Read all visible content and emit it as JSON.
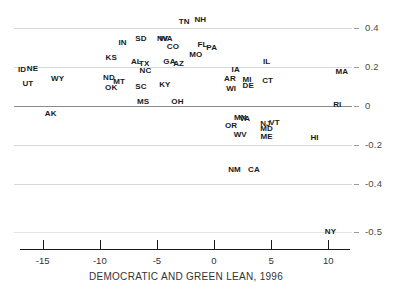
{
  "chart_data": {
    "type": "scatter",
    "title": "",
    "xlabel": "DEMOCRATIC AND GREEN LEAN, 1996",
    "ylabel": "",
    "xlim": [
      -17.5,
      12.5
    ],
    "ylim": [
      -0.55,
      0.47
    ],
    "grid": true,
    "legend": "none",
    "xticks": [
      "-15",
      "-10",
      "-5",
      "0",
      "5",
      "10"
    ],
    "xtick_values": [
      -15,
      -10,
      -5,
      0,
      5,
      10
    ],
    "yticks": [
      "0.4",
      "0.2",
      "0",
      "-0.2",
      "-0.4",
      "-0.5"
    ],
    "ytick_values": [
      0.4,
      0.2,
      0,
      -0.2,
      -0.4,
      -0.5
    ],
    "point_label_type": "state-abbreviation",
    "points": [
      {
        "label": "TN",
        "x": -2.6,
        "y": 0.435
      },
      {
        "label": "NH",
        "x": -1.2,
        "y": 0.445
      },
      {
        "label": "SD",
        "x": -6.4,
        "y": 0.345
      },
      {
        "label": "IN",
        "x": -8.0,
        "y": 0.325
      },
      {
        "label": "NV",
        "x": -4.5,
        "y": 0.345
      },
      {
        "label": "WA",
        "x": -4.2,
        "y": 0.345
      },
      {
        "label": "CO",
        "x": -3.6,
        "y": 0.305
      },
      {
        "label": "FL",
        "x": -1.0,
        "y": 0.315
      },
      {
        "label": "PA",
        "x": -0.2,
        "y": 0.3
      },
      {
        "label": "KS",
        "x": -9.0,
        "y": 0.245
      },
      {
        "label": "MO",
        "x": -1.6,
        "y": 0.265
      },
      {
        "label": "AL",
        "x": -6.8,
        "y": 0.225
      },
      {
        "label": "TX",
        "x": -6.1,
        "y": 0.215
      },
      {
        "label": "GA",
        "x": -3.9,
        "y": 0.225
      },
      {
        "label": "AZ",
        "x": -3.1,
        "y": 0.215
      },
      {
        "label": "IL",
        "x": 4.6,
        "y": 0.225
      },
      {
        "label": "ID",
        "x": -16.8,
        "y": 0.185
      },
      {
        "label": "NE",
        "x": -15.9,
        "y": 0.19
      },
      {
        "label": "NC",
        "x": -6.0,
        "y": 0.18
      },
      {
        "label": "IA",
        "x": 1.9,
        "y": 0.185
      },
      {
        "label": "MA",
        "x": 11.2,
        "y": 0.175
      },
      {
        "label": "ND",
        "x": -9.2,
        "y": 0.145
      },
      {
        "label": "WY",
        "x": -13.7,
        "y": 0.14
      },
      {
        "label": "MT",
        "x": -8.3,
        "y": 0.125
      },
      {
        "label": "AR",
        "x": 1.4,
        "y": 0.14
      },
      {
        "label": "MI",
        "x": 2.9,
        "y": 0.135
      },
      {
        "label": "CT",
        "x": 4.7,
        "y": 0.13
      },
      {
        "label": "UT",
        "x": -16.3,
        "y": 0.115
      },
      {
        "label": "OK",
        "x": -9.0,
        "y": 0.095
      },
      {
        "label": "SC",
        "x": -6.4,
        "y": 0.1
      },
      {
        "label": "KY",
        "x": -4.3,
        "y": 0.11
      },
      {
        "label": "DE",
        "x": 3.0,
        "y": 0.105
      },
      {
        "label": "WI",
        "x": 1.5,
        "y": 0.09
      },
      {
        "label": "MS",
        "x": -6.2,
        "y": 0.02
      },
      {
        "label": "OH",
        "x": -3.2,
        "y": 0.02
      },
      {
        "label": "RI",
        "x": 10.8,
        "y": 0.005
      },
      {
        "label": "AK",
        "x": -14.3,
        "y": -0.04
      },
      {
        "label": "MN",
        "x": 2.3,
        "y": -0.06
      },
      {
        "label": "VA",
        "x": 2.7,
        "y": -0.065
      },
      {
        "label": "OR",
        "x": 1.5,
        "y": -0.105
      },
      {
        "label": "NJ",
        "x": 4.5,
        "y": -0.095
      },
      {
        "label": "VT",
        "x": 5.3,
        "y": -0.09
      },
      {
        "label": "MD",
        "x": 4.6,
        "y": -0.12
      },
      {
        "label": "WV",
        "x": 2.3,
        "y": -0.15
      },
      {
        "label": "ME",
        "x": 4.6,
        "y": -0.16
      },
      {
        "label": "HI",
        "x": 8.8,
        "y": -0.165
      },
      {
        "label": "NM",
        "x": 1.8,
        "y": -0.33
      },
      {
        "label": "CA",
        "x": 3.5,
        "y": -0.33
      },
      {
        "label": "NY",
        "x": 10.2,
        "y": -0.505
      }
    ]
  }
}
